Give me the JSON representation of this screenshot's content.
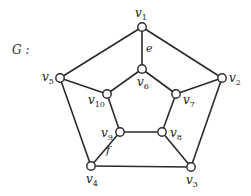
{
  "graph": {
    "name": "G :",
    "vertices": [
      {
        "id": "v1",
        "base": "v",
        "sub": "1",
        "x": 142,
        "y": 27,
        "lx": 135,
        "ly": 17
      },
      {
        "id": "v2",
        "base": "v",
        "sub": "2",
        "x": 222,
        "y": 78,
        "lx": 229,
        "ly": 82
      },
      {
        "id": "v3",
        "base": "v",
        "sub": "3",
        "x": 191,
        "y": 167,
        "lx": 186,
        "ly": 184
      },
      {
        "id": "v4",
        "base": "v",
        "sub": "4",
        "x": 91,
        "y": 166,
        "lx": 86,
        "ly": 183
      },
      {
        "id": "v5",
        "base": "v",
        "sub": "5",
        "x": 60,
        "y": 78,
        "lx": 42,
        "ly": 81
      },
      {
        "id": "v6",
        "base": "v",
        "sub": "6",
        "x": 142,
        "y": 69,
        "lx": 137,
        "ly": 86
      },
      {
        "id": "v7",
        "base": "v",
        "sub": "7",
        "x": 176,
        "y": 94,
        "lx": 183,
        "ly": 104
      },
      {
        "id": "v8",
        "base": "v",
        "sub": "8",
        "x": 162,
        "y": 132,
        "lx": 170,
        "ly": 137
      },
      {
        "id": "v9",
        "base": "v",
        "sub": "9",
        "x": 120,
        "y": 132,
        "lx": 101,
        "ly": 137
      },
      {
        "id": "v10",
        "base": "v",
        "sub": "10",
        "x": 107,
        "y": 94,
        "lx": 88,
        "ly": 104
      }
    ],
    "edges": [
      {
        "from": "v1",
        "to": "v2"
      },
      {
        "from": "v2",
        "to": "v3"
      },
      {
        "from": "v3",
        "to": "v4"
      },
      {
        "from": "v4",
        "to": "v5"
      },
      {
        "from": "v5",
        "to": "v1"
      },
      {
        "from": "v1",
        "to": "v6",
        "label": "e"
      },
      {
        "from": "v2",
        "to": "v7"
      },
      {
        "from": "v3",
        "to": "v8"
      },
      {
        "from": "v4",
        "to": "v9",
        "label": "f"
      },
      {
        "from": "v5",
        "to": "v10"
      },
      {
        "from": "v6",
        "to": "v7"
      },
      {
        "from": "v7",
        "to": "v8"
      },
      {
        "from": "v8",
        "to": "v9"
      },
      {
        "from": "v9",
        "to": "v10"
      },
      {
        "from": "v10",
        "to": "v6"
      }
    ],
    "edge_labels": [
      {
        "text": "e",
        "x": 146,
        "y": 52
      },
      {
        "text": "f",
        "x": 106,
        "y": 154
      }
    ],
    "colors": {
      "stroke": "#2a2a2a",
      "node_fill": "#ffffff"
    }
  }
}
